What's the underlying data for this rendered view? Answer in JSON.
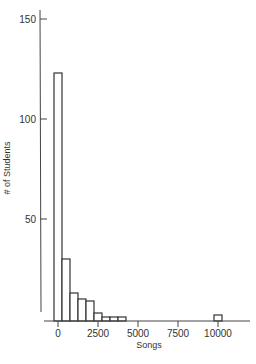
{
  "chart_data": {
    "type": "bar",
    "title": "",
    "xlabel": "Songs",
    "ylabel": "# of Students",
    "bin_width": 500,
    "bins": [
      {
        "start": 0,
        "end": 500,
        "count": 123
      },
      {
        "start": 500,
        "end": 1000,
        "count": 30
      },
      {
        "start": 1000,
        "end": 1500,
        "count": 13
      },
      {
        "start": 1500,
        "end": 2000,
        "count": 10
      },
      {
        "start": 2000,
        "end": 2500,
        "count": 9
      },
      {
        "start": 2500,
        "end": 3000,
        "count": 3
      },
      {
        "start": 3000,
        "end": 3500,
        "count": 1
      },
      {
        "start": 3500,
        "end": 4000,
        "count": 1
      },
      {
        "start": 4000,
        "end": 4500,
        "count": 1
      },
      {
        "start": 10000,
        "end": 10500,
        "count": 2
      }
    ],
    "categories": [
      "0-500",
      "500-1000",
      "1000-1500",
      "1500-2000",
      "2000-2500",
      "2500-3000",
      "3000-3500",
      "3500-4000",
      "4000-4500",
      "10000-10500"
    ],
    "values": [
      123,
      30,
      13,
      10,
      9,
      3,
      1,
      1,
      1,
      2
    ],
    "x_ticks": [
      0,
      2500,
      5000,
      7500,
      10000
    ],
    "y_ticks": [
      50,
      100,
      150
    ],
    "xlim": [
      -1000,
      11500
    ],
    "ylim": [
      0,
      155
    ],
    "grid": false,
    "legend": null
  },
  "axis": {
    "x_label": "Songs",
    "y_label": "# of Students",
    "x_tick_labels": [
      "0",
      "2500",
      "5000",
      "7500",
      "10000"
    ],
    "y_tick_labels": [
      "50",
      "100",
      "150"
    ]
  }
}
